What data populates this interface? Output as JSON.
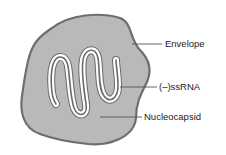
{
  "diagram": {
    "labels": {
      "envelope": "Envelope",
      "rna": "(–)ssRNA",
      "nucleocapsid": "Nucleocapsid"
    },
    "colors": {
      "virion_fill": "#b9b9b9",
      "envelope_stroke": "#6e6e6e",
      "nucleocapsid_fill": "#ffffff",
      "nucleocapsid_stroke": "#6a6a6a",
      "leader_line": "#555555"
    }
  }
}
